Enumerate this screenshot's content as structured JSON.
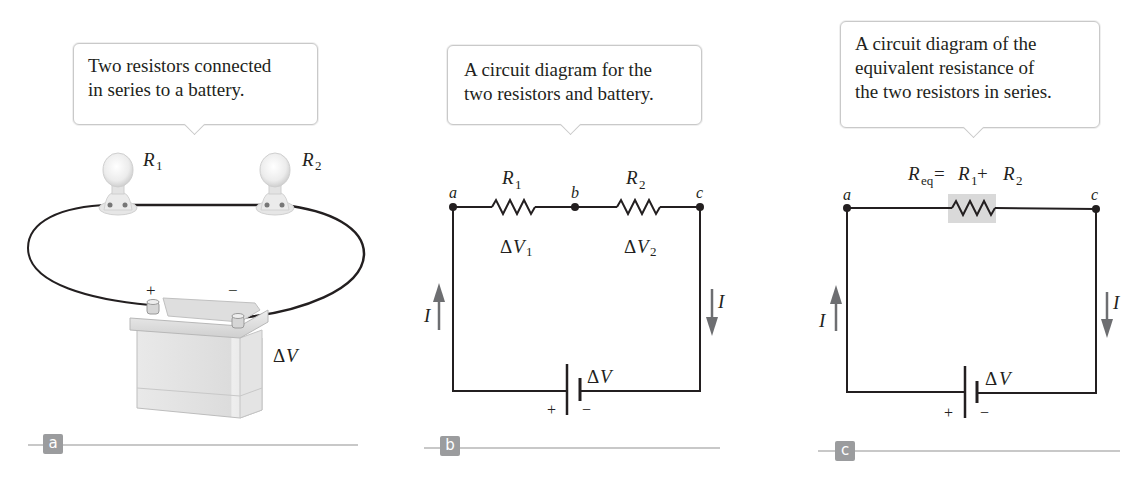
{
  "figure": {
    "panels": [
      {
        "id": "a",
        "badge": "a",
        "callout": "Two resistors connected\nin series to a battery.",
        "labels": {
          "r1": "R",
          "r1_sub": "1",
          "r2": "R",
          "r2_sub": "2",
          "plus": "+",
          "minus": "−",
          "voltage_delta": "Δ",
          "voltage_var": "V"
        }
      },
      {
        "id": "b",
        "badge": "b",
        "callout": "A circuit diagram for the\ntwo resistors and battery.",
        "labels": {
          "node_a": "a",
          "node_b": "b",
          "node_c": "c",
          "r1": "R",
          "r1_sub": "1",
          "r2": "R",
          "r2_sub": "2",
          "dv1_delta": "Δ",
          "dv1_var": "V",
          "dv1_sub": "1",
          "dv2_delta": "Δ",
          "dv2_var": "V",
          "dv2_sub": "2",
          "current_left": "I",
          "current_right": "I",
          "battery_delta": "Δ",
          "battery_var": "V",
          "plus": "+",
          "minus": "−"
        }
      },
      {
        "id": "c",
        "badge": "c",
        "callout": "A circuit diagram of the\nequivalent resistance of\nthe two resistors in series.",
        "labels": {
          "node_a": "a",
          "node_c": "c",
          "req": "R",
          "req_sub": "eq",
          "equals": " =",
          "r1": "R",
          "r1_sub": "1",
          "plus_op": " +",
          "r2": "R",
          "r2_sub": "2",
          "current_left": "I",
          "current_right": "I",
          "battery_delta": "Δ",
          "battery_var": "V",
          "plus": "+",
          "minus": "−"
        }
      }
    ],
    "colors": {
      "wire": "#231f20",
      "arrow": "#6d6e71",
      "badge": "#9b9c9e",
      "rule": "#c8c8c8",
      "req_highlight": "#d9d9d9",
      "callout_border": "#c9c9c9"
    }
  }
}
